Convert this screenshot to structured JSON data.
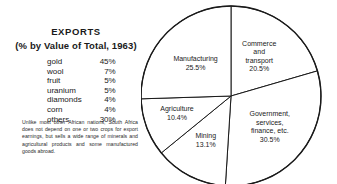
{
  "panel": {
    "title_main": "EXPORTS",
    "title_sub": "(% by Value of Total, 1963)",
    "note": "Unlike most other African nations, South Africa does not depend on one or two crops for export earnings, but sells a wide range of minerals and agricultural products and some manufactured goods abroad."
  },
  "exports_table": {
    "rows": [
      {
        "commodity": "gold",
        "pct": "45%"
      },
      {
        "commodity": "wool",
        "pct": "7%"
      },
      {
        "commodity": "fruit",
        "pct": "5%"
      },
      {
        "commodity": "uranium",
        "pct": "5%"
      },
      {
        "commodity": "diamonds",
        "pct": "4%"
      },
      {
        "commodity": "corn",
        "pct": "4%"
      },
      {
        "commodity": "others",
        "pct": "30%"
      }
    ]
  },
  "chart_data": {
    "type": "pie",
    "title": "",
    "legend": "none",
    "start_angle_deg": 0,
    "direction": "clockwise",
    "unit": "percent",
    "categories": [
      "Commerce and transport",
      "Government, services, finance, etc.",
      "Mining",
      "Agriculture",
      "Manufacturing"
    ],
    "values": [
      20.5,
      30.5,
      13.1,
      10.4,
      25.5
    ],
    "slices": [
      {
        "name": "Commerce and transport",
        "label_lines": [
          "Commerce",
          "and",
          "transport"
        ],
        "value": 20.5,
        "value_label": "20.5%"
      },
      {
        "name": "Government, services, finance, etc.",
        "label_lines": [
          "Government,",
          "services,",
          "finance, etc."
        ],
        "value": 30.5,
        "value_label": "30.5%"
      },
      {
        "name": "Mining",
        "label_lines": [
          "Mining"
        ],
        "value": 13.1,
        "value_label": "13.1%"
      },
      {
        "name": "Agriculture",
        "label_lines": [
          "Agriculture"
        ],
        "value": 10.4,
        "value_label": "10.4%"
      },
      {
        "name": "Manufacturing",
        "label_lines": [
          "Manufacturing"
        ],
        "value": 25.5,
        "value_label": "25.5%"
      }
    ],
    "colors": {
      "slice_fill": "#ffffff",
      "outline": "#1a1a1a",
      "text": "#1a1a1a"
    }
  }
}
